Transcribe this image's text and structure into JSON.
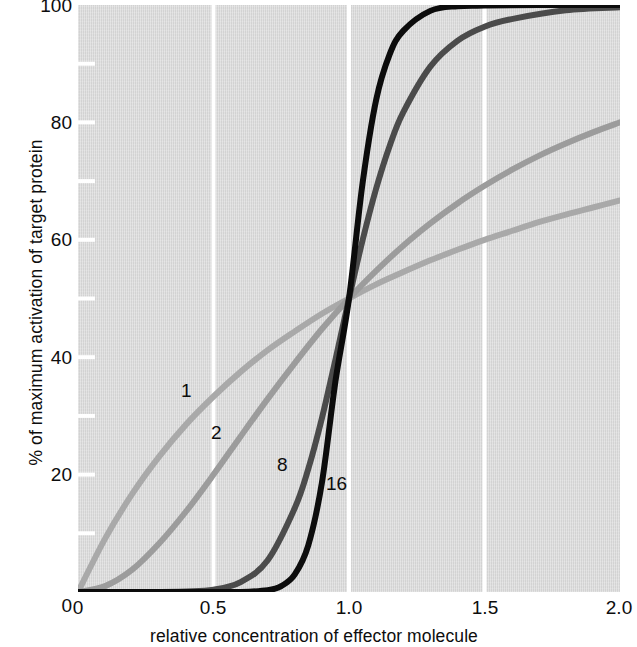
{
  "chart_data": {
    "type": "line",
    "title": "",
    "xlabel": "relative concentration of effector molecule",
    "ylabel": "% of maximum activation of target protein",
    "xlim": [
      0,
      2.0
    ],
    "ylim": [
      0,
      100
    ],
    "xticks": [
      "0",
      "0.5",
      "1.0",
      "1.5",
      "2.0"
    ],
    "xtick_values": [
      0,
      0.5,
      1.0,
      1.5,
      2.0
    ],
    "yticks": [
      "0",
      "20",
      "40",
      "60",
      "80",
      "100"
    ],
    "ytick_values": [
      0,
      20,
      40,
      60,
      80,
      100
    ],
    "minor_ytick_step": 10,
    "grid": "vertical white gridlines at 0.5, 1.0, 1.5",
    "legend": "inline curve labels",
    "plot_background": "#d7d7d7",
    "equation": "y = 100 * x^n / (1 + x^n)  (Hill equation, K = 1)",
    "series": [
      {
        "name": "1",
        "hill_coefficient": 1,
        "color": "#a9a9a9",
        "label_x": 0.4,
        "label_y": 32,
        "x": [
          0.0,
          0.1,
          0.2,
          0.3,
          0.4,
          0.5,
          0.6,
          0.7,
          0.8,
          0.9,
          1.0,
          1.1,
          1.2,
          1.3,
          1.4,
          1.5,
          1.6,
          1.7,
          1.8,
          1.9,
          2.0
        ],
        "values": [
          0.0,
          9.1,
          16.7,
          23.1,
          28.6,
          33.3,
          37.5,
          41.2,
          44.4,
          47.4,
          50.0,
          52.4,
          54.5,
          56.5,
          58.3,
          60.0,
          61.5,
          63.0,
          64.3,
          65.5,
          66.7
        ]
      },
      {
        "name": "2",
        "hill_coefficient": 2,
        "color": "#9c9c9c",
        "label_x": 0.545,
        "label_y": 25,
        "x": [
          0.0,
          0.1,
          0.2,
          0.3,
          0.4,
          0.5,
          0.6,
          0.7,
          0.8,
          0.9,
          1.0,
          1.1,
          1.2,
          1.3,
          1.4,
          1.5,
          1.6,
          1.7,
          1.8,
          1.9,
          2.0
        ],
        "values": [
          0.0,
          1.0,
          3.8,
          8.3,
          13.8,
          20.0,
          26.5,
          32.9,
          39.0,
          44.8,
          50.0,
          54.7,
          59.0,
          62.8,
          66.2,
          69.2,
          71.9,
          74.3,
          76.4,
          78.3,
          80.0
        ]
      },
      {
        "name": "8",
        "hill_coefficient": 8,
        "color": "#4b4b4b",
        "label_x": 0.74,
        "label_y": 19,
        "x": [
          0.0,
          0.2,
          0.4,
          0.5,
          0.6,
          0.7,
          0.8,
          0.85,
          0.9,
          0.95,
          1.0,
          1.05,
          1.1,
          1.15,
          1.2,
          1.3,
          1.4,
          1.5,
          1.6,
          1.8,
          2.0
        ],
        "values": [
          0.0,
          0.0,
          0.1,
          0.4,
          1.7,
          5.4,
          14.3,
          21.0,
          29.6,
          39.6,
          50.0,
          59.9,
          68.7,
          76.0,
          81.7,
          89.5,
          93.9,
          96.3,
          97.6,
          99.1,
          99.6
        ]
      },
      {
        "name": "16",
        "hill_coefficient": 16,
        "color": "#0c0c0c",
        "label_x": 0.905,
        "label_y": 13,
        "x": [
          0.0,
          0.3,
          0.5,
          0.6,
          0.7,
          0.75,
          0.8,
          0.85,
          0.9,
          0.95,
          1.0,
          1.05,
          1.1,
          1.15,
          1.2,
          1.3,
          1.4,
          1.5,
          1.7,
          2.0
        ],
        "values": [
          0.0,
          0.0,
          0.0,
          0.0,
          0.3,
          1.0,
          3.0,
          8.0,
          18.6,
          35.9,
          50.0,
          69.6,
          83.8,
          91.6,
          95.6,
          99.0,
          99.8,
          99.9,
          100.0,
          100.0
        ]
      }
    ]
  },
  "axes": {
    "y_title": "% of maximum activation of target protein",
    "x_title": "relative concentration of effector molecule",
    "y_tick_labels": [
      "100",
      "80",
      "60",
      "40",
      "20",
      "0"
    ],
    "x_tick_labels": [
      "0",
      "0.5",
      "1.0",
      "1.5",
      "2.0"
    ]
  },
  "curve_labels": {
    "n1": "1",
    "n2": "2",
    "n8": "8",
    "n16": "16"
  }
}
